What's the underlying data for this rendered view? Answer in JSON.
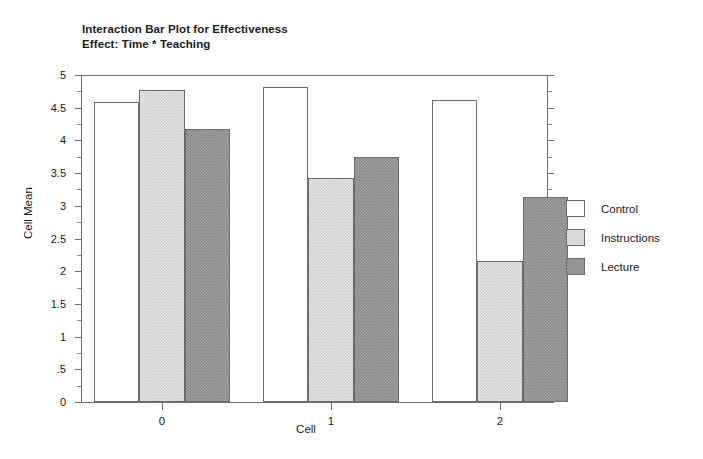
{
  "chart_data": {
    "type": "bar",
    "title": "Interaction Bar Plot for Effectiveness",
    "subtitle": "Effect: Time * Teaching",
    "xlabel": "Cell",
    "ylabel": "Cell Mean",
    "categories": [
      "0",
      "1",
      "2"
    ],
    "ylim": [
      0,
      5
    ],
    "ytick_values": [
      0,
      0.5,
      1,
      1.5,
      2,
      2.5,
      3,
      3.5,
      4,
      4.5,
      5
    ],
    "ytick_labels": [
      "0",
      ".5",
      "1",
      "1.5",
      "2",
      "2.5",
      "3",
      "3.5",
      "4",
      "4.5",
      "5"
    ],
    "yminor_step": 0.25,
    "grid": false,
    "legend_position": "right",
    "series": [
      {
        "name": "Control",
        "color": "#ffffff",
        "values": [
          4.58,
          4.81,
          4.62
        ]
      },
      {
        "name": "Instructions",
        "color": "#cfcfcf",
        "values": [
          4.77,
          3.43,
          2.16
        ]
      },
      {
        "name": "Lecture",
        "color": "#8a8a8a",
        "values": [
          4.17,
          3.75,
          3.14
        ]
      }
    ]
  },
  "legend": {
    "items": [
      {
        "label": "Control"
      },
      {
        "label": "Instructions"
      },
      {
        "label": "Lecture"
      }
    ]
  }
}
